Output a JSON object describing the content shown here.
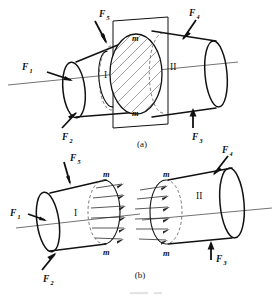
{
  "figure": {
    "line_color": "#111111",
    "hidden_line_color": "#555555",
    "axis_color": "#444444",
    "background": "#ffffff"
  },
  "panels": [
    {
      "id": "panel-a",
      "caption": "(a)",
      "description": "Bar under five external forces cut by section plane m-m",
      "segments": [
        {
          "label": "I",
          "name": "segment-one"
        },
        {
          "label": "II",
          "name": "segment-two"
        }
      ],
      "section_labels": [
        {
          "text": "m",
          "position": "top"
        },
        {
          "text": "m",
          "position": "bottom"
        }
      ],
      "forces": [
        {
          "label": "F",
          "subscript": "1",
          "name": "force-f1",
          "direction": "right"
        },
        {
          "label": "F",
          "subscript": "2",
          "name": "force-f2",
          "direction": "up-right"
        },
        {
          "label": "F",
          "subscript": "3",
          "name": "force-f3",
          "direction": "up"
        },
        {
          "label": "F",
          "subscript": "4",
          "name": "force-f4",
          "direction": "down-left"
        },
        {
          "label": "F",
          "subscript": "5",
          "name": "force-f5",
          "direction": "down-right"
        }
      ]
    },
    {
      "id": "panel-b",
      "caption": "(b)",
      "description": "Separated free bodies showing internal force distribution on the cut faces",
      "segments": [
        {
          "label": "I",
          "name": "segment-one-free-body"
        },
        {
          "label": "II",
          "name": "segment-two-free-body"
        }
      ],
      "section_labels": [
        {
          "text": "m",
          "position": "left-top"
        },
        {
          "text": "m",
          "position": "left-bottom"
        },
        {
          "text": "m",
          "position": "right-top"
        },
        {
          "text": "m",
          "position": "right-bottom"
        }
      ],
      "forces": [
        {
          "label": "F",
          "subscript": "1",
          "name": "force-f1",
          "direction": "right"
        },
        {
          "label": "F",
          "subscript": "2",
          "name": "force-f2",
          "direction": "up-right"
        },
        {
          "label": "F",
          "subscript": "3",
          "name": "force-f3",
          "direction": "up"
        },
        {
          "label": "F",
          "subscript": "4",
          "name": "force-f4",
          "direction": "down-left"
        },
        {
          "label": "F",
          "subscript": "5",
          "name": "force-f5",
          "direction": "down-right"
        }
      ]
    }
  ]
}
